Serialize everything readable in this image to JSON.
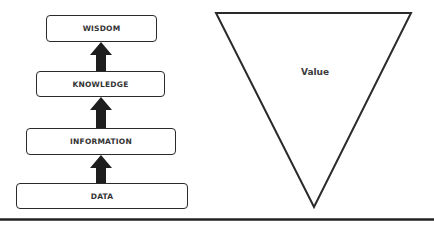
{
  "diagram": {
    "hierarchy": {
      "levels": [
        {
          "label": "WISDOM"
        },
        {
          "label": "KNOWLEDGE"
        },
        {
          "label": "INFORMATION"
        },
        {
          "label": "DATA"
        }
      ]
    },
    "funnel": {
      "label": "Value"
    },
    "colors": {
      "stroke": "#2a2a2a",
      "text": "#333333",
      "background": "#ffffff"
    }
  }
}
